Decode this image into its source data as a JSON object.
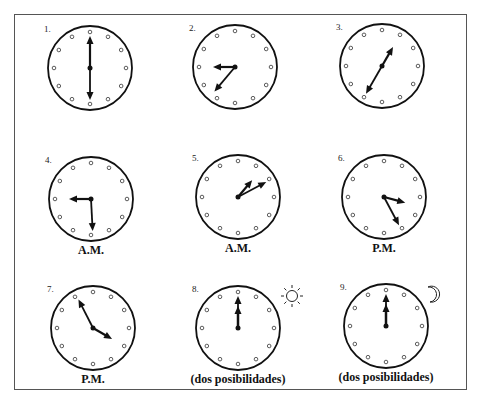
{
  "worksheet": {
    "clocks": [
      {
        "number": "1.",
        "hour_angle": 0,
        "minute_angle": 180,
        "caption": "",
        "note": "6:00 or 12:30 style, hands vertical"
      },
      {
        "number": "2.",
        "hour_angle": 270,
        "minute_angle": 220,
        "caption": ""
      },
      {
        "number": "3.",
        "hour_angle": 30,
        "minute_angle": 210,
        "caption": ""
      },
      {
        "number": "4.",
        "hour_angle": 270,
        "minute_angle": 177,
        "caption": "A.M."
      },
      {
        "number": "5.",
        "hour_angle": 40,
        "minute_angle": 62,
        "caption": "A.M."
      },
      {
        "number": "6.",
        "hour_angle": 105,
        "minute_angle": 152,
        "caption": "P.M."
      },
      {
        "number": "7.",
        "hour_angle": 120,
        "minute_angle": 333,
        "caption": "P.M."
      },
      {
        "number": "8.",
        "hour_angle": 0,
        "minute_angle": 0,
        "caption": "(dos posibilidades)",
        "icon": "sun-icon"
      },
      {
        "number": "9.",
        "hour_angle": 0,
        "minute_angle": 0,
        "caption": "(dos posibilidades)",
        "icon": "moon-icon"
      }
    ]
  }
}
